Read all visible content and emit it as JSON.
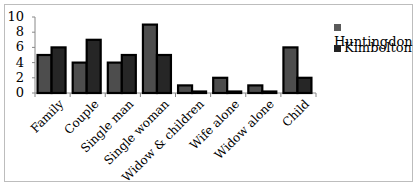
{
  "chart_data": {
    "type": "bar",
    "title": "",
    "xlabel": "",
    "ylabel": "",
    "ylim": [
      0,
      10
    ],
    "yticks": [
      0,
      2,
      4,
      6,
      8,
      10
    ],
    "grid": false,
    "legend_position": "right",
    "categories": [
      "Family",
      "Couple",
      "Single man",
      "Single woman",
      "Widow & children",
      "Wife alone",
      "Widow alone",
      "Child"
    ],
    "series": [
      {
        "name": "Huntingdon",
        "color": "#4d4d4d",
        "values": [
          5,
          4,
          4,
          9,
          1,
          2,
          1,
          6
        ]
      },
      {
        "name": "Kimbolton",
        "color": "#262626",
        "values": [
          6,
          7,
          5,
          5,
          0,
          0,
          0,
          2
        ]
      }
    ]
  },
  "legend": {
    "items": [
      "Huntingdon",
      "Kimbolton"
    ]
  }
}
